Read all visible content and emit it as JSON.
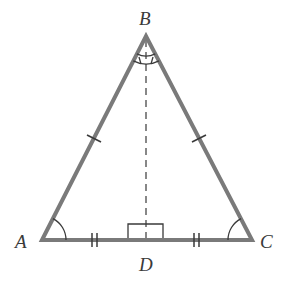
{
  "diagram": {
    "type": "isosceles-triangle-with-altitude",
    "colors": {
      "sides": "#7a7a7a",
      "marks": "#3a3a3a",
      "labels": "#3a3a3a",
      "background": "#ffffff"
    },
    "vertices": {
      "A": {
        "label": "A",
        "x": 42,
        "y": 240
      },
      "B": {
        "label": "B",
        "x": 146,
        "y": 36
      },
      "C": {
        "label": "C",
        "x": 252,
        "y": 240
      },
      "D": {
        "label": "D",
        "x": 146,
        "y": 240
      }
    },
    "segments": [
      {
        "name": "AB",
        "style": "solid",
        "tick_marks": 1
      },
      {
        "name": "BC",
        "style": "solid",
        "tick_marks": 1
      },
      {
        "name": "AD",
        "style": "solid",
        "tick_marks": 2
      },
      {
        "name": "DC",
        "style": "solid",
        "tick_marks": 2
      },
      {
        "name": "BD",
        "style": "dashed",
        "tick_marks": 0
      }
    ],
    "angle_marks": [
      {
        "vertex": "A",
        "arcs": 1
      },
      {
        "vertex": "C",
        "arcs": 1
      },
      {
        "vertex": "B",
        "arcs": 2,
        "note": "split by BD, tick on each arc"
      }
    ],
    "right_angle": {
      "vertex": "D"
    }
  }
}
